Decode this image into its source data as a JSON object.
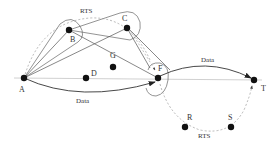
{
  "diagram": {
    "type": "network-routing",
    "colors": {
      "node": "#111111",
      "solid_edge": "#444444",
      "dashed_edge": "#999999",
      "hull": "#555555",
      "text": "#333333",
      "background": "#ffffff"
    },
    "nodes": [
      {
        "id": "A",
        "label": "A",
        "x": 24,
        "y": 78
      },
      {
        "id": "B",
        "label": "B",
        "x": 69,
        "y": 30
      },
      {
        "id": "C",
        "label": "C",
        "x": 127,
        "y": 28
      },
      {
        "id": "G",
        "label": "G",
        "x": 113,
        "y": 67
      },
      {
        "id": "D",
        "label": "D",
        "x": 86,
        "y": 78
      },
      {
        "id": "F",
        "label": "F",
        "x": 158,
        "y": 78
      },
      {
        "id": "T",
        "label": "T",
        "x": 254,
        "y": 80
      },
      {
        "id": "R",
        "label": "R",
        "x": 185,
        "y": 127
      },
      {
        "id": "S",
        "label": "S",
        "x": 231,
        "y": 127
      }
    ],
    "edge_labels": {
      "rts_top": "RTS",
      "rts_bottom": "RTS",
      "data_bottom": "Data",
      "data_top": "Data"
    },
    "edges": [
      {
        "from": "A",
        "to": "B",
        "style": "solid"
      },
      {
        "from": "A",
        "to": "C",
        "style": "solid"
      },
      {
        "from": "B",
        "to": "F",
        "style": "solid"
      },
      {
        "from": "C",
        "to": "F",
        "style": "solid-arrow"
      },
      {
        "from": "A",
        "to": "F",
        "style": "curved-arrow",
        "label": "Data"
      },
      {
        "from": "F",
        "to": "T",
        "style": "curved-arrow",
        "label": "Data"
      },
      {
        "from": "A",
        "to": "C",
        "style": "dashed-curve",
        "label": "RTS"
      },
      {
        "from": "F",
        "to": "T",
        "style": "dashed-curve-via-R-S",
        "label": "RTS"
      },
      {
        "from": "A",
        "to": "T",
        "style": "thin-baseline"
      }
    ]
  }
}
